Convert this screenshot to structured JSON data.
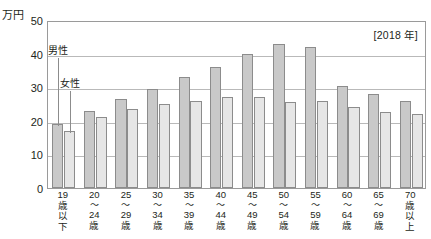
{
  "chart_data": {
    "type": "bar",
    "title": "",
    "subtitle": "",
    "unit_label": "万円",
    "year_badge": "[2018 年]",
    "xlabel": "",
    "ylabel": "万円",
    "ylim": [
      0,
      50
    ],
    "yticks": [
      0,
      10,
      20,
      30,
      40,
      50
    ],
    "ytick_labels": [
      "0",
      "10",
      "20",
      "30",
      "40",
      "50"
    ],
    "grid": true,
    "legend_position": "inline-annotation",
    "categories": [
      "19歳以下",
      "20〜24歳",
      "25〜29歳",
      "30〜34歳",
      "35〜39歳",
      "40〜44歳",
      "45〜49歳",
      "50〜54歳",
      "55〜59歳",
      "60〜64歳",
      "65〜69歳",
      "70歳以上"
    ],
    "category_lines": [
      [
        "19",
        "歳",
        "以",
        "下"
      ],
      [
        "20",
        "〜",
        "24",
        "歳"
      ],
      [
        "25",
        "〜",
        "29",
        "歳"
      ],
      [
        "30",
        "〜",
        "34",
        "歳"
      ],
      [
        "35",
        "〜",
        "39",
        "歳"
      ],
      [
        "40",
        "〜",
        "44",
        "歳"
      ],
      [
        "45",
        "〜",
        "49",
        "歳"
      ],
      [
        "50",
        "〜",
        "54",
        "歳"
      ],
      [
        "55",
        "〜",
        "59",
        "歳"
      ],
      [
        "60",
        "〜",
        "64",
        "歳"
      ],
      [
        "65",
        "〜",
        "69",
        "歳"
      ],
      [
        "70",
        "歳",
        "以",
        "上"
      ]
    ],
    "series": [
      {
        "name": "男性",
        "color": "#c9c9c9",
        "values": [
          19,
          23,
          26.5,
          29.5,
          33,
          36,
          40,
          43,
          42,
          30.5,
          28,
          26
        ]
      },
      {
        "name": "女性",
        "color": "#e6e6e6",
        "values": [
          17,
          21,
          23.5,
          25,
          26,
          27,
          27,
          25.5,
          26,
          24,
          22.5,
          22
        ]
      }
    ],
    "annotations": [
      {
        "text": "男性",
        "target_series": "男性",
        "target_category": "19歳以下"
      },
      {
        "text": "女性",
        "target_series": "女性",
        "target_category": "19歳以下"
      }
    ]
  },
  "colors": {
    "male_fill": "#c9c9c9",
    "female_fill": "#e6e6e6",
    "bar_stroke": "#8c8c8c",
    "gridline": "#b9b9b9",
    "frame": "#9a9a9a",
    "text": "#231f20"
  }
}
